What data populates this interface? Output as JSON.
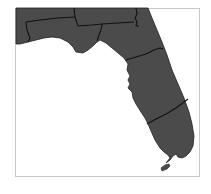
{
  "map": {
    "title": "Florida regions",
    "subject": "Florida",
    "colors": {
      "background": "#ffffff",
      "land": "#4b4b4b",
      "border": "#111111",
      "frame": "#c8c8c8"
    },
    "regions": [
      {
        "name": "northwest-panhandle"
      },
      {
        "name": "north-panhandle"
      },
      {
        "name": "north-central"
      },
      {
        "name": "northeast"
      },
      {
        "name": "central"
      },
      {
        "name": "south"
      }
    ]
  }
}
